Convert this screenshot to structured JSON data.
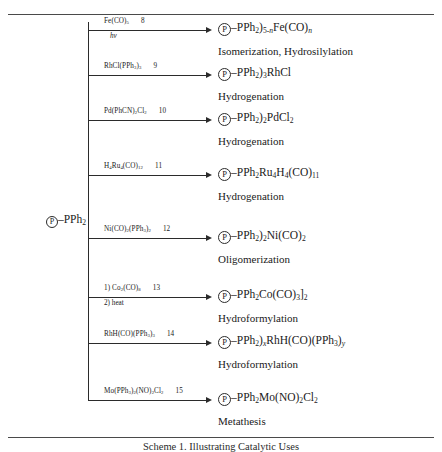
{
  "figure": {
    "caption": "Scheme 1. Illustrating Catalytic Uses",
    "support_label": "P",
    "starting_material": "Ⓟ–PPh₂",
    "rules": {
      "top": true,
      "bottom": true
    }
  },
  "reactions": [
    {
      "id": "8",
      "reagent": "Fe(CO)₅",
      "reagent_number": "8",
      "condition": "hν",
      "product": "Ⓟ–PPh₂)₅₋ₙFe(CO)ₙ",
      "application": "Isomerization, Hydrosilylation"
    },
    {
      "id": "9",
      "reagent": "RhCl(PPh₃)₃",
      "reagent_number": "9",
      "condition": "",
      "product": "Ⓟ–PPh₂)₃RhCl",
      "application": "Hydrogenation"
    },
    {
      "id": "10",
      "reagent": "Pd(PhCN)₂Cl₂",
      "reagent_number": "10",
      "condition": "",
      "product": "Ⓟ–PPh₂)₂PdCl₂",
      "application": "Hydrogenation"
    },
    {
      "id": "11",
      "reagent": "H₄Ru₄(CO)₁₂",
      "reagent_number": "11",
      "condition": "",
      "product": "Ⓟ–PPh₂Ru₄H₄(CO)₁₁",
      "application": "Hydrogenation"
    },
    {
      "id": "12",
      "reagent": "Ni(CO)₂(PPh₃)₂",
      "reagent_number": "12",
      "condition": "",
      "product": "Ⓟ–PPh₂)₂Ni(CO)₂",
      "application": "Oligomerization"
    },
    {
      "id": "13",
      "reagent": "1) Co₂(CO)₈",
      "reagent_number": "13",
      "condition": "2) heat",
      "product": "Ⓟ–PPh₂Co(CO)₃]₂",
      "application": "Hydroformylation"
    },
    {
      "id": "14",
      "reagent": "RhH(CO)(PPh₃)₃",
      "reagent_number": "14",
      "condition": "",
      "product": "Ⓟ–PPh₂)ₓRhH(CO)(PPh₃)ᵧ",
      "application": "Hydroformylation"
    },
    {
      "id": "15",
      "reagent": "Mo(PPh₃)₂(NO)₂Cl₂",
      "reagent_number": "15",
      "condition": "",
      "product": "Ⓟ–PPh₂Mo(NO)₂Cl₂",
      "application": "Metathesis"
    }
  ]
}
